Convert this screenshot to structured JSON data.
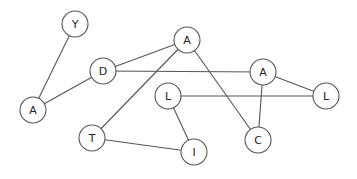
{
  "diagram": {
    "type": "undirected-graph",
    "style": {
      "background": "#ffffff",
      "node_fill": "#ffffff",
      "node_stroke": "#555555",
      "edge_stroke": "#555555",
      "label_color": "#222222",
      "node_radius": 13
    },
    "nodes": [
      {
        "id": "n_y",
        "label": "Y",
        "x": 75,
        "y": 24
      },
      {
        "id": "n_d",
        "label": "D",
        "x": 103,
        "y": 71
      },
      {
        "id": "n_a1",
        "label": "A",
        "x": 33,
        "y": 110
      },
      {
        "id": "n_a2",
        "label": "A",
        "x": 187,
        "y": 40
      },
      {
        "id": "n_a3",
        "label": "A",
        "x": 263,
        "y": 72
      },
      {
        "id": "n_l1",
        "label": "L",
        "x": 168,
        "y": 96
      },
      {
        "id": "n_l2",
        "label": "L",
        "x": 326,
        "y": 96
      },
      {
        "id": "n_t",
        "label": "T",
        "x": 92,
        "y": 138
      },
      {
        "id": "n_i",
        "label": "I",
        "x": 194,
        "y": 152
      },
      {
        "id": "n_c",
        "label": "C",
        "x": 258,
        "y": 140
      }
    ],
    "edges": [
      {
        "from": "n_y",
        "to": "n_a1"
      },
      {
        "from": "n_a1",
        "to": "n_d"
      },
      {
        "from": "n_d",
        "to": "n_a2"
      },
      {
        "from": "n_d",
        "to": "n_a3"
      },
      {
        "from": "n_a2",
        "to": "n_t"
      },
      {
        "from": "n_a2",
        "to": "n_c"
      },
      {
        "from": "n_a3",
        "to": "n_c"
      },
      {
        "from": "n_a3",
        "to": "n_l2"
      },
      {
        "from": "n_l1",
        "to": "n_l2"
      },
      {
        "from": "n_l1",
        "to": "n_i"
      },
      {
        "from": "n_t",
        "to": "n_i"
      }
    ]
  }
}
